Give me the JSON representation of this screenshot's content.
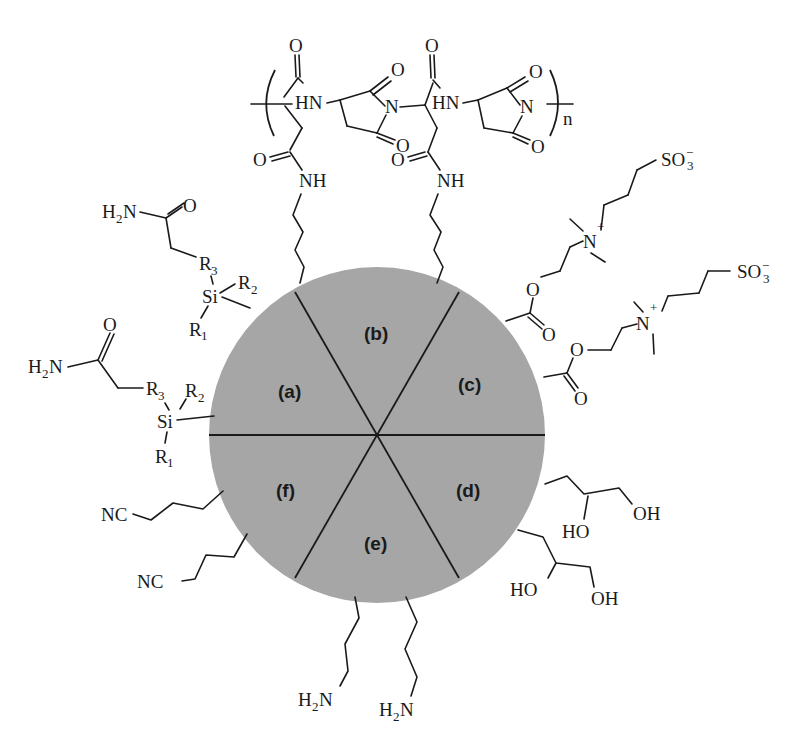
{
  "figure": {
    "particle": {
      "fill_color": "#a6a6a6",
      "divider_color": "#1a1a1a",
      "segments": [
        {
          "id": "a",
          "label": "(a)",
          "chemistry": "amide silane"
        },
        {
          "id": "b",
          "label": "(b)",
          "chemistry": "polysuccinimide / aspartamide"
        },
        {
          "id": "c",
          "label": "(c)",
          "chemistry": "sulfobetaine zwitterion"
        },
        {
          "id": "d",
          "label": "(d)",
          "chemistry": "diol"
        },
        {
          "id": "e",
          "label": "(e)",
          "chemistry": "amine"
        },
        {
          "id": "f",
          "label": "(f)",
          "chemistry": "nitrile"
        }
      ]
    },
    "labels": {
      "polymer_repeat": "n",
      "O": "O",
      "N": "N",
      "HN": "HN",
      "NH": "NH",
      "H2N_H": "H",
      "H2N_2": "2",
      "H2N_N": "N",
      "R": "R",
      "R1_sub": "1",
      "R2_sub": "2",
      "R3_sub": "3",
      "Si": "Si",
      "NC": "NC",
      "OH": "OH",
      "HO": "HO",
      "SO3": "SO",
      "SO3_sub": "3",
      "SO3_charge": "−",
      "N_plus": "N",
      "plus": "+"
    }
  }
}
